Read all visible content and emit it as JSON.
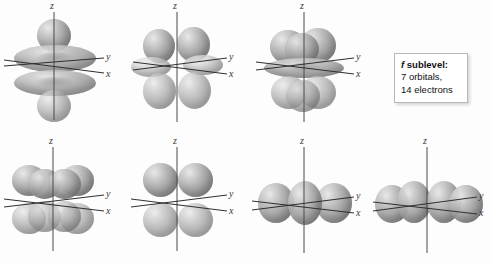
{
  "figure": {
    "background_color": "#fdfdfd",
    "lobe_color": "#9a9a9a",
    "axis_color": "#3a3a3a"
  },
  "axis_labels": {
    "x": "x",
    "y": "y",
    "z": "z"
  },
  "legend": {
    "heading_italic": "f",
    "heading_rest": " sublevel:",
    "line2": "7 orbitals,",
    "line3": "14 electrons",
    "orbital_count": 7,
    "electron_count": 14,
    "border_color": "#b9b9b9",
    "background_color": "#ffffff"
  },
  "orbitals": [
    {
      "index": 1,
      "row": 1,
      "col": 1,
      "name": "f-orbital-1",
      "description": "two axial lobes along z with two toroidal rings"
    },
    {
      "index": 2,
      "row": 1,
      "col": 2,
      "name": "f-orbital-2",
      "description": "six-lobe cloverleaf, two lobes up, two down, two along axes"
    },
    {
      "index": 3,
      "row": 1,
      "col": 3,
      "name": "f-orbital-3",
      "description": "clustered lobes above and below a central ring"
    },
    {
      "index": 4,
      "row": 2,
      "col": 1,
      "name": "f-orbital-4",
      "description": "eight lobes in a cubic arrangement"
    },
    {
      "index": 5,
      "row": 2,
      "col": 2,
      "name": "f-orbital-5",
      "description": "four lobes, two above and two below the xy plane"
    },
    {
      "index": 6,
      "row": 2,
      "col": 3,
      "name": "f-orbital-6",
      "description": "three lobes in a row along the y axis"
    },
    {
      "index": 7,
      "row": 2,
      "col": 4,
      "name": "f-orbital-7",
      "description": "four lobes in a row along the y axis"
    }
  ]
}
